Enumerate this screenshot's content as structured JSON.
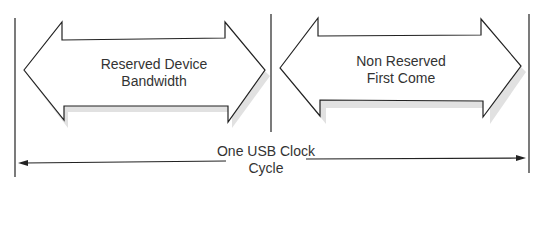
{
  "diagram": {
    "segments": [
      {
        "line1": "Reserved Device",
        "line2": "Bandwidth"
      },
      {
        "line1": "Non Reserved",
        "line2": "First Come"
      }
    ],
    "cycle_label": {
      "line1": "One USB Clock",
      "line2": "Cycle"
    },
    "colors": {
      "stroke": "#222222",
      "shadow": "#d8d8d8",
      "text": "#333333"
    }
  }
}
